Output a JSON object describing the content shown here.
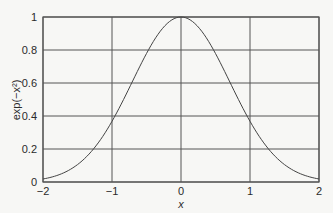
{
  "chart_data": {
    "type": "line",
    "title": "",
    "xlabel": "x",
    "ylabel": "exp(−x²)",
    "xlim": [
      -2,
      2
    ],
    "ylim": [
      0,
      1
    ],
    "x_ticks": [
      "−2",
      "−1",
      "0",
      "1",
      "2"
    ],
    "y_ticks": [
      "0",
      "0.2",
      "0.4",
      "0.6",
      "0.8",
      "1"
    ],
    "grid": true,
    "legend": null,
    "series": [
      {
        "name": "exp(-x^2)",
        "x": [
          -2,
          -1.5,
          -1,
          -0.5,
          0,
          0.5,
          1,
          1.5,
          2
        ],
        "values": [
          0.018,
          0.105,
          0.368,
          0.779,
          1.0,
          0.779,
          0.368,
          0.105,
          0.018
        ]
      }
    ],
    "colors": {
      "line": "#444444",
      "grid": "#555555",
      "background": "#f7f7f5"
    }
  }
}
